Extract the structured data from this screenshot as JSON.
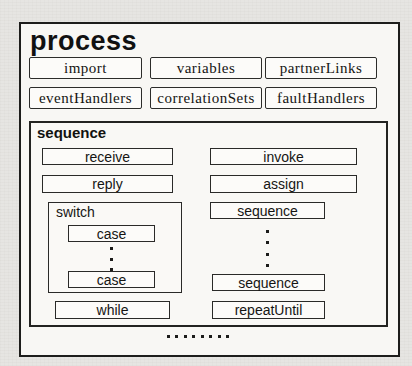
{
  "colors": {
    "page_background": "#e6e5e2",
    "panel_background": "#f8f7f4",
    "box_background": "#fcfbf9",
    "border": "#1d1d1b",
    "text": "#161614"
  },
  "process": {
    "title": "process",
    "declaration_boxes": [
      "import",
      "variables",
      "partnerLinks",
      "eventHandlers",
      "correlationSets",
      "faultHandlers"
    ],
    "sequence": {
      "label": "sequence",
      "receive": "receive",
      "reply": "reply",
      "invoke": "invoke",
      "assign": "assign",
      "switch": {
        "label": "switch",
        "cases": [
          "case",
          "case"
        ]
      },
      "sequence_top": "sequence",
      "sequence_bottom": "sequence",
      "while": "while",
      "repeat_until": "repeatUntil"
    },
    "ellipses": {
      "switch_vertical_dots": 3,
      "right_vertical_dots": 4,
      "bottom_horizontal_dots": 8
    }
  }
}
